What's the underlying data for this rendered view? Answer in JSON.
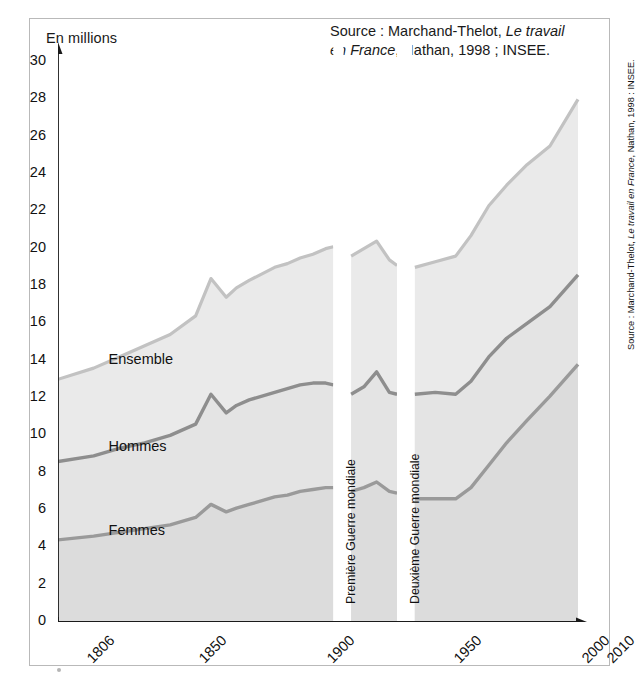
{
  "figure": {
    "axis_unit_label": "En millions",
    "source_line1_plain": "Source : Marchand-Thelot, ",
    "source_line1_italic": "Le travail",
    "source_line2_italic": "en France",
    "source_line2_plain": ", Nathan, 1998 ; INSEE.",
    "side_credit_plain1": "Source : Marchand-Thelot, ",
    "side_credit_italic": "Le travail en France",
    "side_credit_plain2": ", Nathan, 1998 : INSEE.",
    "colors": {
      "fill_ensemble": "#eaeaea",
      "fill_hommes": "#e4e4e4",
      "fill_femmes": "#dcdcdc",
      "line_ensemble": "#c2c2c2",
      "line_hommes": "#8e8e8e",
      "line_femmes": "#9a9a9a",
      "axis": "#1a1a1a",
      "frame": "#b9b9b9",
      "war_gap": "#ffffff"
    }
  },
  "annotations": [
    {
      "name": "war-1",
      "label": "Première Guerre mondiale",
      "x_start": 1914,
      "x_end": 1918
    },
    {
      "name": "war-2",
      "label": "Deuxième Guerre mondiale",
      "x_start": 1939,
      "x_end": 1945
    }
  ],
  "series_labels": {
    "ensemble": "Ensemble",
    "hommes": "Hommes",
    "femmes": "Femmes"
  },
  "chart_data": {
    "type": "area",
    "title": "",
    "subtitle": "",
    "xlabel": "",
    "ylabel": "En millions",
    "ylim": [
      0,
      30
    ],
    "xlim": [
      1806,
      2010
    ],
    "yticks": [
      0,
      2,
      4,
      6,
      8,
      10,
      12,
      14,
      16,
      18,
      20,
      22,
      24,
      26,
      28,
      30
    ],
    "xticks_labeled": [
      1806,
      1850,
      1900,
      1950,
      2000,
      2010
    ],
    "xticks_minor_step": 10,
    "grid": false,
    "legend": "inline-labels",
    "stacked": true,
    "x": [
      1806,
      1820,
      1830,
      1840,
      1850,
      1860,
      1866,
      1872,
      1876,
      1881,
      1891,
      1896,
      1901,
      1906,
      1911,
      1914,
      1918,
      1921,
      1926,
      1931,
      1936,
      1939,
      1945,
      1946,
      1954,
      1962,
      1968,
      1975,
      1982,
      1990,
      1999,
      2010
    ],
    "series": [
      {
        "name": "Femmes",
        "values": [
          4.4,
          4.6,
          4.8,
          5.0,
          5.2,
          5.6,
          6.3,
          5.9,
          6.1,
          6.3,
          6.7,
          6.8,
          7.0,
          7.1,
          7.2,
          7.2,
          null,
          7.0,
          7.2,
          7.5,
          7.0,
          6.9,
          null,
          6.6,
          6.6,
          6.6,
          7.2,
          8.4,
          9.6,
          10.8,
          12.1,
          13.8
        ]
      },
      {
        "name": "Hommes",
        "values": [
          4.2,
          4.3,
          4.5,
          4.6,
          4.8,
          5.0,
          5.9,
          5.3,
          5.5,
          5.6,
          5.6,
          5.7,
          5.7,
          5.7,
          5.6,
          5.5,
          null,
          5.2,
          5.4,
          5.9,
          5.3,
          5.3,
          null,
          5.6,
          5.7,
          5.6,
          5.7,
          5.8,
          5.6,
          5.2,
          4.8,
          4.8
        ]
      },
      {
        "name": "Ensemble",
        "values": [
          13.0,
          13.6,
          14.2,
          14.8,
          15.4,
          16.4,
          18.4,
          17.4,
          17.9,
          18.3,
          19.0,
          19.2,
          19.5,
          19.7,
          20.0,
          20.1,
          null,
          19.6,
          20.0,
          20.4,
          19.4,
          19.1,
          null,
          19.0,
          19.3,
          19.6,
          20.7,
          22.3,
          23.4,
          24.5,
          25.5,
          28.0
        ]
      }
    ],
    "notes": [
      "Ensemble is the top boundary (total active population).",
      "Hommes is the middle boundary; Femmes is the bottom boundary.",
      "White vertical bands mark the two world wars (no data)."
    ]
  }
}
